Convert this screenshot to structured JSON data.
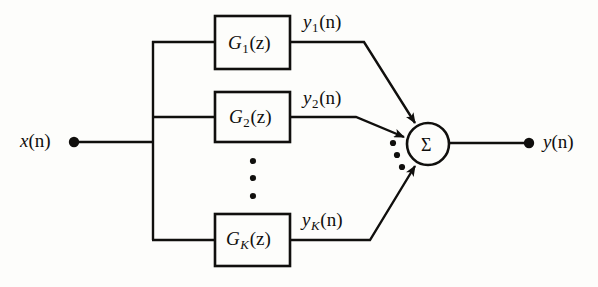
{
  "figure": {
    "type": "block-diagram",
    "background_color": "#fdfdfb",
    "line_color": "#100f0d"
  },
  "input": {
    "label_var": "x",
    "label_arg": "(n)",
    "terminal": "input-terminal-dot"
  },
  "output": {
    "label_var": "y",
    "label_arg": "(n)",
    "terminal": "output-terminal-dot"
  },
  "summer": {
    "symbol": "Σ",
    "name": "summing-junction"
  },
  "blocks": [
    {
      "id": "g1",
      "name_var": "G",
      "subscript": "1",
      "arg": "(z)",
      "output_var": "y",
      "output_subscript": "1",
      "output_arg": "(n)"
    },
    {
      "id": "g2",
      "name_var": "G",
      "subscript": "2",
      "arg": "(z)",
      "output_var": "y",
      "output_subscript": "2",
      "output_arg": "(n)"
    },
    {
      "id": "gk",
      "name_var": "G",
      "subscript": "K",
      "arg": "(z)",
      "output_var": "y",
      "output_subscript": "K",
      "output_arg": "(n)"
    }
  ],
  "ellipsis": {
    "vertical_dots": "⋮",
    "diagonal_dots": "⋰",
    "count": 3
  }
}
